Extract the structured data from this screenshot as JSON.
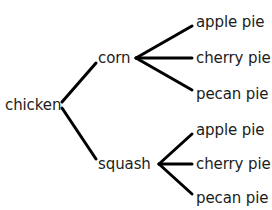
{
  "diagram": {
    "type": "tree-diagram",
    "background_color": "#ffffff",
    "line_color": "#000000",
    "text_color": "#1c1c1c",
    "line_width": 3,
    "root": {
      "label": "chicken",
      "label_x": 5,
      "label_y": 105,
      "vertex_x": 58,
      "vertex_y": 105
    },
    "branches": [
      {
        "label": "corn",
        "label_x": 98,
        "label_y": 58,
        "edge_start_x": 62,
        "edge_start_y": 102,
        "edge_end_x": 96,
        "edge_end_y": 63,
        "vertex_x": 136,
        "vertex_y": 58,
        "leaves": [
          {
            "label": "apple pie",
            "label_x": 196,
            "label_y": 22,
            "edge_end_x": 192,
            "edge_end_y": 26
          },
          {
            "label": "cherry pie",
            "label_x": 196,
            "label_y": 58,
            "edge_end_x": 192,
            "edge_end_y": 58
          },
          {
            "label": "pecan pie",
            "label_x": 196,
            "label_y": 94,
            "edge_end_x": 192,
            "edge_end_y": 90
          }
        ]
      },
      {
        "label": "squash",
        "label_x": 98,
        "label_y": 164,
        "edge_start_x": 62,
        "edge_start_y": 108,
        "edge_end_x": 96,
        "edge_end_y": 159,
        "vertex_x": 159,
        "vertex_y": 164,
        "leaves": [
          {
            "label": "apple pie",
            "label_x": 196,
            "label_y": 130,
            "edge_end_x": 192,
            "edge_end_y": 134
          },
          {
            "label": "cherry pie",
            "label_x": 196,
            "label_y": 164,
            "edge_end_x": 192,
            "edge_end_y": 164
          },
          {
            "label": "pecan pie",
            "label_x": 196,
            "label_y": 198,
            "edge_end_x": 192,
            "edge_end_y": 194
          }
        ]
      }
    ]
  }
}
